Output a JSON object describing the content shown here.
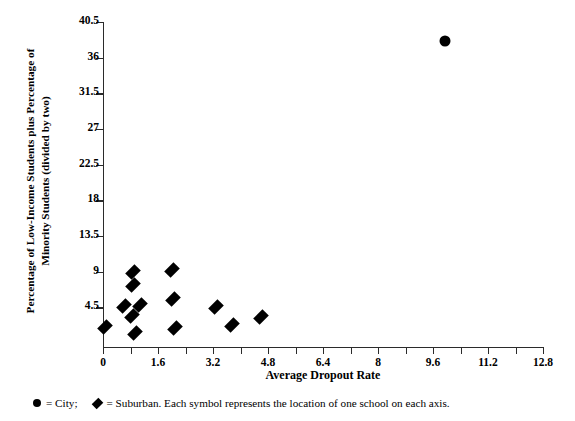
{
  "chart_data": {
    "type": "scatter",
    "title": "",
    "xlabel": "Average Dropout Rate",
    "ylabel_line1": "Percentage of Low-Income Students plus Percentage of",
    "ylabel_line2": "Minority Students (divided by two)",
    "xlim": [
      0,
      12.8
    ],
    "ylim": [
      -0.5,
      40.5
    ],
    "xticks": [
      0,
      1.6,
      3.2,
      4.8,
      6.4,
      8,
      9.6,
      11.2,
      12.8
    ],
    "xtick_labels": [
      "0",
      "1.6",
      "3.2",
      "4.8",
      "6.4",
      "8",
      "9.6",
      "11.2",
      "12.8"
    ],
    "x_minor_ticks": [
      0.8,
      2.4,
      4.0,
      5.6,
      7.2,
      8.8,
      10.4,
      12.0
    ],
    "yticks": [
      4.5,
      9,
      13.5,
      18,
      22.5,
      27,
      31.5,
      36,
      40.5
    ],
    "ytick_labels": [
      "4.5",
      "9",
      "13.5",
      "18",
      "22.5",
      "27",
      "31.5",
      "36",
      "40.5"
    ],
    "grid": false,
    "legend_position": "below-axes",
    "series": [
      {
        "name": "City",
        "marker": "circle",
        "color": "#000000",
        "points": [
          {
            "x": 9.95,
            "y": 38.1
          }
        ]
      },
      {
        "name": "Suburban",
        "marker": "diamond",
        "color": "#000000",
        "points": [
          {
            "x": 0.05,
            "y": 2.0
          },
          {
            "x": 0.62,
            "y": 4.7
          },
          {
            "x": 0.85,
            "y": 3.4
          },
          {
            "x": 0.88,
            "y": 9.0
          },
          {
            "x": 0.88,
            "y": 7.3
          },
          {
            "x": 0.92,
            "y": 1.3
          },
          {
            "x": 1.08,
            "y": 4.8
          },
          {
            "x": 2.0,
            "y": 9.2
          },
          {
            "x": 2.05,
            "y": 5.6
          },
          {
            "x": 2.1,
            "y": 1.9
          },
          {
            "x": 3.3,
            "y": 4.6
          },
          {
            "x": 3.75,
            "y": 2.3
          },
          {
            "x": 4.6,
            "y": 3.3
          }
        ]
      }
    ],
    "annotations": []
  },
  "legend": {
    "city_symbol_name": "filled-circle",
    "city_text": "= City;",
    "suburban_symbol_name": "filled-diamond",
    "suburban_text": "= Suburban. Each symbol represents the location of one school on each axis."
  }
}
